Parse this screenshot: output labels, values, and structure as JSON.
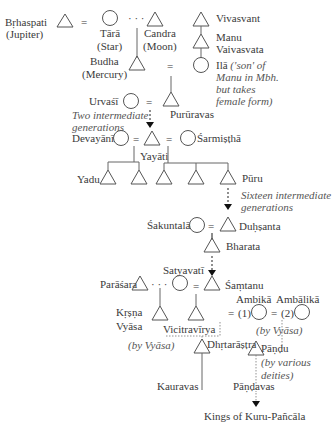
{
  "persons": {
    "brhaspati": {
      "name": "Bṛhaspati",
      "note": "(Jupiter)"
    },
    "tara": {
      "name": "Tārā",
      "note": "(Star)"
    },
    "candra": {
      "name": "Candra",
      "note": "(Moon)"
    },
    "vivasvant": {
      "name": "Vivasvant"
    },
    "manu": {
      "name": "Manu",
      "name2": "Vaivasvata"
    },
    "ila": {
      "name": "Ilā",
      "note1": "('son' of",
      "note2": "Manu in Mbh.",
      "note3": "but takes",
      "note4": "female form)"
    },
    "budha": {
      "name": "Budha",
      "note": "(Mercury)"
    },
    "urvasi": {
      "name": "Urvaśī"
    },
    "pururavas": {
      "name": "Purūravas"
    },
    "devayani": {
      "name": "Devayānī"
    },
    "yayati": {
      "name": "Yayāti"
    },
    "sarmistha": {
      "name": "Śarmiṣṭhā"
    },
    "yadu": {
      "name": "Yadu"
    },
    "puru": {
      "name": "Pūru"
    },
    "sakuntala": {
      "name": "Śakuntalā"
    },
    "duhsanta": {
      "name": "Duḥṣanta"
    },
    "bharata": {
      "name": "Bharata"
    },
    "satyavati": {
      "name": "Satyavatī"
    },
    "parasara": {
      "name": "Parāśara"
    },
    "santanu": {
      "name": "Śaṃtanu"
    },
    "krsna_vyasa": {
      "name": "Kṛṣṇa",
      "name2": "Vyāsa"
    },
    "vicitravirya": {
      "name": "Vicitravīrya"
    },
    "ambika": {
      "name": "Ambikā"
    },
    "ambalika": {
      "name": "Ambālikā"
    },
    "dhrtarastra": {
      "name": "Dhṛtarāṣṭra"
    },
    "pandu": {
      "name": "Pāṇḍu"
    },
    "kauravas": {
      "name": "Kauravas"
    },
    "pandavas": {
      "name": "Pāṇḍavas"
    },
    "kings": {
      "name": "Kings of Kuru-Pañcāla"
    }
  },
  "annotations": {
    "two_gen_1": "Two intermediate",
    "two_gen_2": "generations",
    "sixteen_gen_1": "Sixteen intermediate",
    "sixteen_gen_2": "generations",
    "by_vyasa_1": "(by Vyāsa)",
    "by_vyasa_2": "(by Vyāsa)",
    "by_deities_1": "(by various",
    "by_deities_2": "deities)",
    "wife1": "(1)",
    "wife2": "(2)"
  },
  "symbols": {
    "marriage": "=",
    "liaison": "· · ·"
  }
}
